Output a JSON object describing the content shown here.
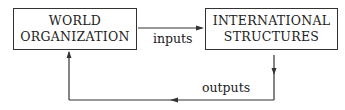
{
  "diagram": {
    "left_box": {
      "line1": "WORLD",
      "line2": "ORGANIZATION"
    },
    "right_box": {
      "line1": "INTERNATIONAL",
      "line2": "STRUCTURES"
    },
    "edge_top_label": "inputs",
    "edge_bottom_label": "outputs"
  }
}
